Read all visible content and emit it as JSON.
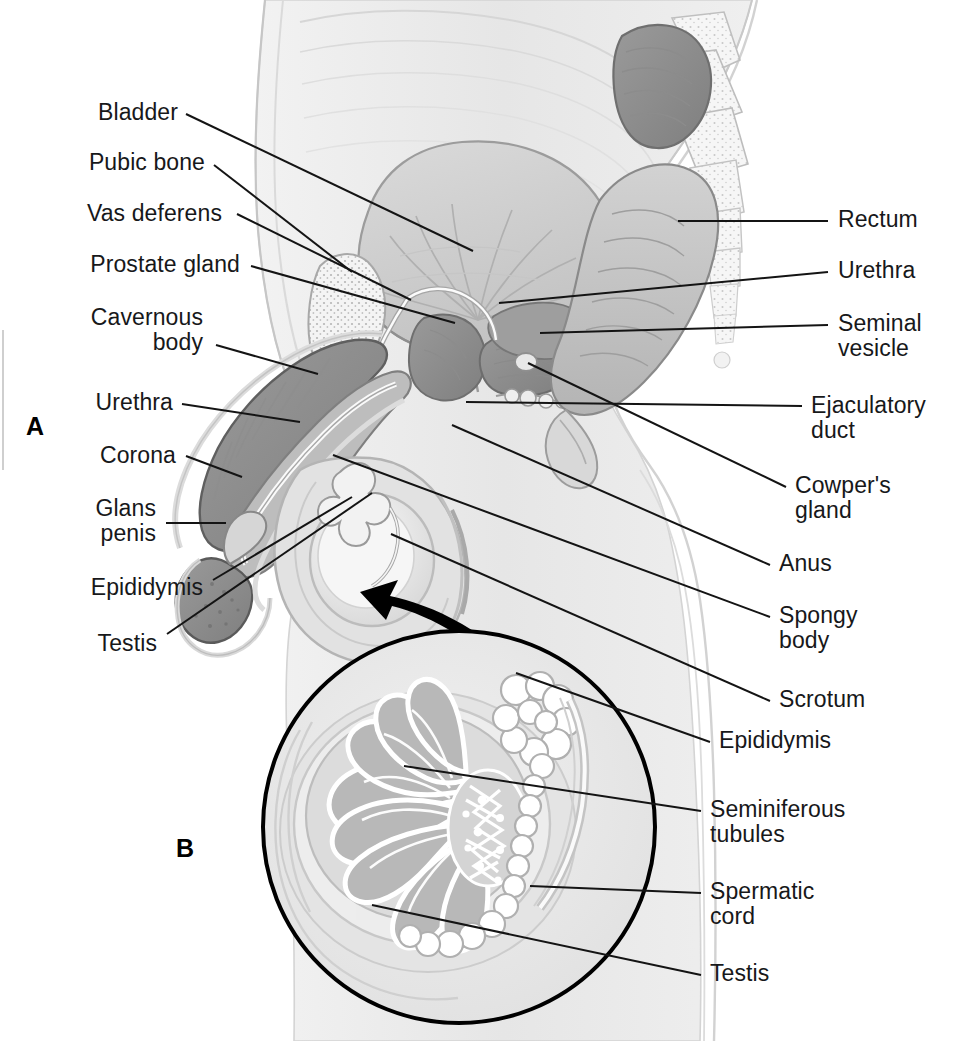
{
  "figure": {
    "panels": [
      {
        "id": "A",
        "label": "A",
        "description": "Midsagittal section of the male pelvis"
      },
      {
        "id": "B",
        "label": "B",
        "description": "Magnified detail of testis and epididymis"
      }
    ],
    "background_color": "#ffffff",
    "line_color": "#1a1a1a",
    "tissue_fill": "#e9e9e9",
    "organ_fill": "#b9b9b9",
    "organ_dark": "#8e8e8e"
  },
  "labels_left": [
    {
      "name": "bladder",
      "text": "Bladder",
      "x": 90,
      "y": 100,
      "right": 178,
      "lx1": 186,
      "ly1": 114,
      "lx2": 473,
      "ly2": 251
    },
    {
      "name": "pubic-bone",
      "text": "Pubic bone",
      "x": 90,
      "y": 150,
      "right": 205,
      "lx1": 214,
      "ly1": 165,
      "lx2": 352,
      "ly2": 272
    },
    {
      "name": "vas-deferens",
      "text": "Vas deferens",
      "x": 90,
      "y": 201,
      "right": 222,
      "lx1": 237,
      "ly1": 214,
      "lx2": 411,
      "ly2": 300
    },
    {
      "name": "prostate-gland",
      "text": "Prostate gland",
      "x": 90,
      "y": 252,
      "right": 240,
      "lx1": 251,
      "ly1": 266,
      "lx2": 455,
      "ly2": 323
    },
    {
      "name": "cavernous-body",
      "text": "Cavernous\nbody",
      "x": 90,
      "y": 305,
      "right": 203,
      "lx1": 216,
      "ly1": 345,
      "lx2": 318,
      "ly2": 374
    },
    {
      "name": "urethra-penile",
      "text": "Urethra",
      "x": 90,
      "y": 390,
      "right": 173,
      "lx1": 182,
      "ly1": 404,
      "lx2": 300,
      "ly2": 422
    },
    {
      "name": "corona",
      "text": "Corona",
      "x": 90,
      "y": 443,
      "right": 176,
      "lx1": 186,
      "ly1": 456,
      "lx2": 242,
      "ly2": 477
    },
    {
      "name": "glans-penis",
      "text": "Glans\npenis",
      "x": 90,
      "y": 496,
      "right": 156,
      "lx1": 166,
      "ly1": 523,
      "lx2": 226,
      "ly2": 523
    },
    {
      "name": "epididymis-a",
      "text": "Epididymis",
      "x": 90,
      "y": 575,
      "right": 203,
      "lx1": 213,
      "ly1": 580,
      "lx2": 352,
      "ly2": 497
    },
    {
      "name": "testis-a",
      "text": "Testis",
      "x": 90,
      "y": 631,
      "right": 157,
      "lx1": 167,
      "ly1": 634,
      "lx2": 372,
      "ly2": 493
    }
  ],
  "labels_right": [
    {
      "name": "rectum",
      "text": "Rectum",
      "x": 838,
      "y": 207,
      "lx1": 828,
      "ly1": 221,
      "lx2": 678,
      "ly2": 221
    },
    {
      "name": "urethra-prostatic",
      "text": "Urethra",
      "x": 838,
      "y": 258,
      "lx1": 828,
      "ly1": 272,
      "lx2": 499,
      "ly2": 303
    },
    {
      "name": "seminal-vesicle",
      "text": "Seminal\nvesicle",
      "x": 838,
      "y": 311,
      "lx1": 828,
      "ly1": 325,
      "lx2": 540,
      "ly2": 333
    },
    {
      "name": "ejaculatory-duct",
      "text": "Ejaculatory\nduct",
      "x": 811,
      "y": 393,
      "lx1": 802,
      "ly1": 406,
      "lx2": 466,
      "ly2": 402
    },
    {
      "name": "cowpers-gland",
      "text": "Cowper's\ngland",
      "x": 795,
      "y": 473,
      "lx1": 786,
      "ly1": 487,
      "lx2": 528,
      "ly2": 363
    },
    {
      "name": "anus",
      "text": "Anus",
      "x": 779,
      "y": 551,
      "lx1": 770,
      "ly1": 565,
      "lx2": 452,
      "ly2": 425
    },
    {
      "name": "spongy-body",
      "text": "Spongy\nbody",
      "x": 779,
      "y": 603,
      "lx1": 770,
      "ly1": 617,
      "lx2": 333,
      "ly2": 455
    },
    {
      "name": "scrotum",
      "text": "Scrotum",
      "x": 779,
      "y": 687,
      "lx1": 770,
      "ly1": 701,
      "lx2": 391,
      "ly2": 534
    },
    {
      "name": "epididymis-b",
      "text": "Epididymis",
      "x": 719,
      "y": 728,
      "lx1": 710,
      "ly1": 742,
      "lx2": 516,
      "ly2": 673
    },
    {
      "name": "seminiferous-tubules",
      "text": "Seminiferous\ntubules",
      "x": 710,
      "y": 797,
      "lx1": 701,
      "ly1": 811,
      "lx2": 404,
      "ly2": 766
    },
    {
      "name": "spermatic-cord",
      "text": "Spermatic\ncord",
      "x": 710,
      "y": 879,
      "lx1": 701,
      "ly1": 893,
      "lx2": 530,
      "ly2": 886
    },
    {
      "name": "testis-b",
      "text": "Testis",
      "x": 710,
      "y": 961,
      "lx1": 701,
      "ly1": 975,
      "lx2": 372,
      "ly2": 905
    }
  ],
  "panel_marks": [
    {
      "name": "panel-a-mark",
      "text": "A",
      "x": 26,
      "y": 412
    },
    {
      "name": "panel-b-mark",
      "text": "B",
      "x": 176,
      "y": 834
    }
  ],
  "inset": {
    "name": "testis-detail-inset",
    "center_x": 459,
    "center_y": 827,
    "radius": 196,
    "arrow_label": "magnification-arrow"
  }
}
